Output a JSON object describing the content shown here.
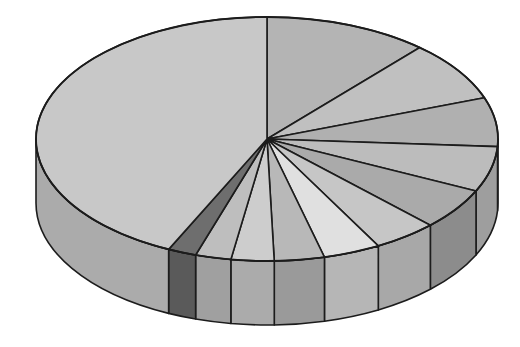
{
  "figure": {
    "title": "",
    "background_color": "#ffffff",
    "width": 520,
    "height": 347
  },
  "geometry": {
    "center_x": 267,
    "center_y": 139,
    "radius_x": 231,
    "radius_y": 122,
    "depth": 64,
    "stroke_color": "#1c1c1c",
    "stroke_width": 1.6
  },
  "chart_data": {
    "type": "pie",
    "title": "",
    "subtitle": "",
    "xlabel": "",
    "ylabel": "",
    "legend": [],
    "annotations": [],
    "three_d": true,
    "grid": false,
    "start_angle_deg": 0,
    "direction": "clockwise",
    "categories": [
      "Slice 1",
      "Slice 2",
      "Slice 3",
      "Slice 4",
      "Slice 5",
      "Slice 6",
      "Slice 7",
      "Slice 8",
      "Slice 9",
      "Slice 10",
      "Slice 11",
      "Slice 12"
    ],
    "values": [
      11.5,
      8.0,
      6.5,
      6.0,
      5.5,
      4.5,
      4.0,
      3.5,
      3.0,
      2.5,
      2.0,
      43.0
    ],
    "units": "percent",
    "slices": [
      {
        "label": "Slice 1",
        "value": 11.5,
        "start_deg": 0,
        "end_deg": 41.4,
        "top_color": "#b4b4b4",
        "side_color": "#9a9a9a",
        "visible_side": false
      },
      {
        "label": "Slice 2",
        "value": 8.0,
        "start_deg": 41.4,
        "end_deg": 70.2,
        "top_color": "#c0c0c0",
        "side_color": "#a2a2a2",
        "visible_side": false
      },
      {
        "label": "Slice 3",
        "value": 6.5,
        "start_deg": 70.2,
        "end_deg": 93.6,
        "top_color": "#b0b0b0",
        "side_color": "#949494",
        "visible_side": true
      },
      {
        "label": "Slice 4",
        "value": 6.0,
        "start_deg": 93.6,
        "end_deg": 115.2,
        "top_color": "#bcbcbc",
        "side_color": "#9e9e9e",
        "visible_side": true
      },
      {
        "label": "Slice 5",
        "value": 5.5,
        "start_deg": 115.2,
        "end_deg": 135.0,
        "top_color": "#aaaaaa",
        "side_color": "#8c8c8c",
        "visible_side": true
      },
      {
        "label": "Slice 6",
        "value": 4.5,
        "start_deg": 135.0,
        "end_deg": 151.2,
        "top_color": "#c6c6c6",
        "side_color": "#a8a8a8",
        "visible_side": true
      },
      {
        "label": "Slice 7",
        "value": 4.0,
        "start_deg": 151.2,
        "end_deg": 165.6,
        "top_color": "#e0e0e0",
        "side_color": "#b6b6b6",
        "visible_side": true
      },
      {
        "label": "Slice 8",
        "value": 3.5,
        "start_deg": 165.6,
        "end_deg": 178.2,
        "top_color": "#b8b8b8",
        "side_color": "#9a9a9a",
        "visible_side": true
      },
      {
        "label": "Slice 9",
        "value": 3.0,
        "start_deg": 178.2,
        "end_deg": 189.0,
        "top_color": "#cdcdcd",
        "side_color": "#ababab",
        "visible_side": true
      },
      {
        "label": "Slice 10",
        "value": 2.5,
        "start_deg": 189.0,
        "end_deg": 198.0,
        "top_color": "#bebebe",
        "side_color": "#a0a0a0",
        "visible_side": true
      },
      {
        "label": "Slice 11",
        "value": 2.0,
        "start_deg": 198.0,
        "end_deg": 205.2,
        "top_color": "#6e6e6e",
        "side_color": "#5a5a5a",
        "visible_side": true
      },
      {
        "label": "Slice 12",
        "value": 43.0,
        "start_deg": 205.2,
        "end_deg": 360.0,
        "top_color": "#c8c8c8",
        "side_color": "#ababab",
        "visible_side": true
      }
    ],
    "palette": [
      "#b4b4b4",
      "#c0c0c0",
      "#b0b0b0",
      "#bcbcbc",
      "#aaaaaa",
      "#c6c6c6",
      "#e0e0e0",
      "#b8b8b8",
      "#cdcdcd",
      "#bebebe",
      "#6e6e6e",
      "#c8c8c8"
    ]
  }
}
